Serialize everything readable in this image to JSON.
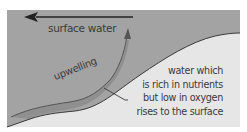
{
  "diagram": {
    "labels": {
      "surface_water": "surface water",
      "upwelling": "upwelling"
    },
    "callout_lines": [
      "water which",
      "is rich in nutrients",
      "but low in oxygen",
      "rises to the surface"
    ],
    "colors": {
      "water": "#a3a3a3",
      "seabed": "#e6e6e6",
      "upwelling_band": "#8f8f8f",
      "lines": "#3a3a3a",
      "text": "#3a3a3a"
    }
  }
}
